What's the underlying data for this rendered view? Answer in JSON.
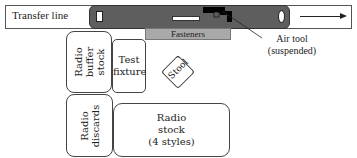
{
  "diagram": {
    "transfer_line": {
      "label": "Transfer line",
      "direction": "right"
    },
    "fasteners": {
      "label": "Fasteners"
    },
    "air_tool": {
      "label_line1": "Air tool",
      "label_line2": "(suspended)"
    },
    "radio_buffer_stock": {
      "label_line1": "Radio",
      "label_line2": "buffer",
      "label_line3": "stock"
    },
    "test_fixture": {
      "label_line1": "Test",
      "label_line2": "fixture"
    },
    "stool": {
      "label": "Stool"
    },
    "radio_discards": {
      "label_line1": "Radio",
      "label_line2": "discards"
    },
    "radio_stock": {
      "label_line1": "Radio",
      "label_line2": "stock",
      "label_line3": "(4 styles)"
    },
    "colors": {
      "conveyor": "#5e5e5e",
      "fasteners": "#a9a9a9",
      "tool": "#000000"
    }
  }
}
